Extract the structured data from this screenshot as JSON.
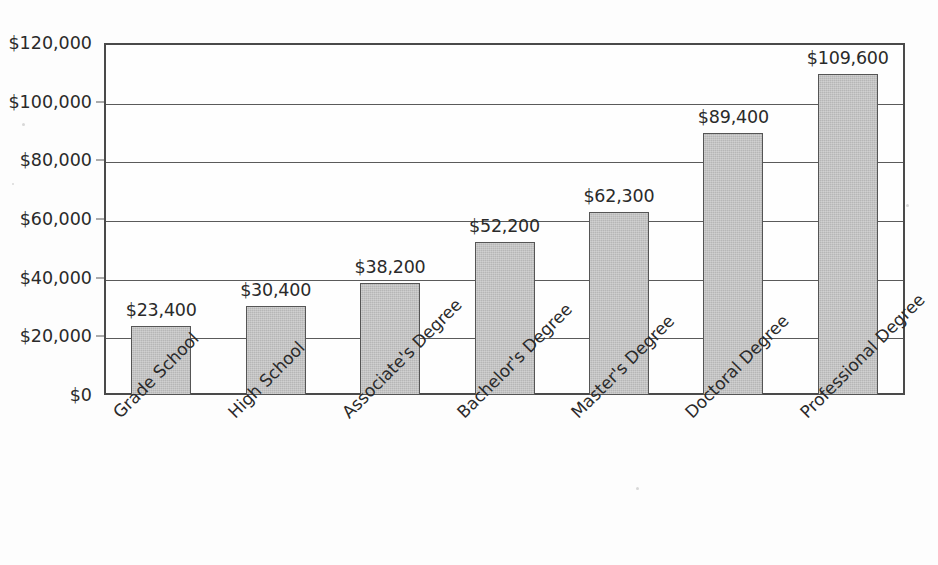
{
  "chart_data": {
    "type": "bar",
    "title": "",
    "subtitle": "",
    "xlabel": "",
    "ylabel": "",
    "categories": [
      "Grade School",
      "High School",
      "Associate's Degree",
      "Bachelor's Degree",
      "Master's Degree",
      "Doctoral Degree",
      "Professional Degree"
    ],
    "values": [
      23400,
      30400,
      38200,
      52200,
      62300,
      89400,
      109600
    ],
    "value_labels": [
      "$23,400",
      "$30,400",
      "$38,200",
      "$52,200",
      "$62,300",
      "$89,400",
      "$109,600"
    ],
    "ylim": [
      0,
      120000
    ],
    "ytick_values": [
      0,
      20000,
      40000,
      60000,
      80000,
      100000,
      120000
    ],
    "ytick_labels": [
      "$0",
      "$20,000",
      "$40,000",
      "$60,000",
      "$80,000",
      "$100,000",
      "$120,000"
    ],
    "grid": true,
    "grid_axis": "y",
    "legend": false,
    "legend_position": "none",
    "bar_fill_color": "#b6b6b6",
    "bar_border_color": "#555555",
    "axis_color": "#4a4a4a",
    "background_color": "#fdfdfd",
    "text_color": "#2a2a2a",
    "category_label_rotation_deg": -45
  }
}
